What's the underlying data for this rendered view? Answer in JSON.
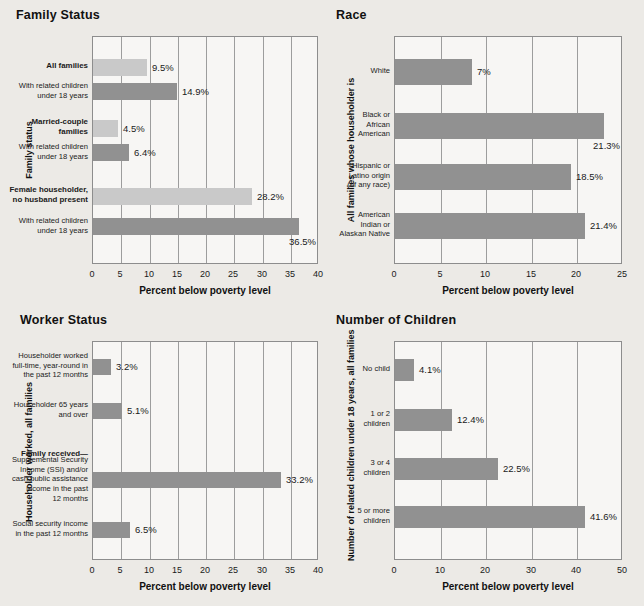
{
  "page": {
    "background": "#eceae6",
    "bar_light": "#c9c9c9",
    "bar_dark": "#919191"
  },
  "common": {
    "xtitle": "Percent below poverty level"
  },
  "chart_data": [
    {
      "id": "family-status",
      "type": "bar",
      "orientation": "horizontal",
      "title": "Family Status",
      "ylabel": "Family status",
      "xlabel": "Percent below poverty level",
      "xlim": [
        0,
        40
      ],
      "xticks": [
        0,
        5,
        10,
        15,
        20,
        25,
        30,
        35,
        40
      ],
      "grid": true,
      "categories": [
        "All families",
        "With related children\nunder 18 years",
        "Married-couple\nfamilies",
        "With related children\nunder 18 years",
        "Female householder,\nno husband present",
        "With related children\nunder 18 years"
      ],
      "values": [
        9.5,
        14.9,
        4.5,
        6.4,
        28.2,
        36.5
      ],
      "labels": [
        "9.5%",
        "14.9%",
        "4.5%",
        "6.4%",
        "28.2%",
        "36.5%"
      ],
      "shades": [
        "light",
        "dark",
        "light",
        "dark",
        "light",
        "dark"
      ],
      "emphasis": [
        true,
        false,
        true,
        false,
        true,
        false
      ]
    },
    {
      "id": "race",
      "type": "bar",
      "orientation": "horizontal",
      "title": "Race",
      "ylabel": "All families whose householder is",
      "xlabel": "Percent below poverty level",
      "xlim": [
        0,
        25
      ],
      "xticks": [
        0,
        5,
        10,
        15,
        20,
        25
      ],
      "grid": true,
      "categories": [
        "White",
        "Black or\nAfrican\nAmerican",
        "Hispanic or\nLatino origin\n(of any race)",
        "American\nIndian or\nAlaskan Native"
      ],
      "values": [
        7,
        21.3,
        18.5,
        21.4
      ],
      "plotted": [
        8.4,
        22.9,
        19.3,
        20.8
      ],
      "labels": [
        "7%",
        "21.3%",
        "18.5%",
        "21.4%"
      ],
      "shades": [
        "dark",
        "dark",
        "dark",
        "dark"
      ],
      "emphasis": [
        false,
        false,
        false,
        false
      ]
    },
    {
      "id": "worker-status",
      "type": "bar",
      "orientation": "horizontal",
      "title": "Worker Status",
      "ylabel": "Householder worked, all families",
      "xlabel": "Percent below poverty level",
      "xlim": [
        0,
        40
      ],
      "xticks": [
        0,
        5,
        10,
        15,
        20,
        25,
        30,
        35,
        40
      ],
      "grid": true,
      "categories": [
        "Householder worked\nfull-time, year-round in\nthe past 12 months",
        "Householder 65 years\nand over",
        "Family received—",
        "Supplemental Security\nIncome (SSI) and/or\ncash public assistance\nincome in the past\n12 months",
        "Social security income\nin the past 12 months"
      ],
      "values": [
        3.2,
        5.1,
        null,
        33.2,
        6.5
      ],
      "labels": [
        "3.2%",
        "5.1%",
        "",
        "33.2%",
        "6.5%"
      ],
      "shades": [
        "dark",
        "dark",
        "none",
        "dark",
        "dark"
      ],
      "emphasis": [
        false,
        false,
        true,
        false,
        false
      ]
    },
    {
      "id": "number-of-children",
      "type": "bar",
      "orientation": "horizontal",
      "title": "Number of Children",
      "ylabel": "Number of related children under 18 years, all families",
      "xlabel": "Percent below poverty level",
      "xlim": [
        0,
        50
      ],
      "xticks": [
        0,
        10,
        20,
        30,
        40,
        50
      ],
      "grid": true,
      "categories": [
        "No child",
        "1 or 2\nchildren",
        "3 or 4\nchildren",
        "5 or more\nchildren"
      ],
      "values": [
        4.1,
        12.4,
        22.5,
        41.6
      ],
      "labels": [
        "4.1%",
        "12.4%",
        "22.5%",
        "41.6%"
      ],
      "shades": [
        "dark",
        "dark",
        "dark",
        "dark"
      ],
      "emphasis": [
        false,
        false,
        false,
        false
      ]
    }
  ]
}
